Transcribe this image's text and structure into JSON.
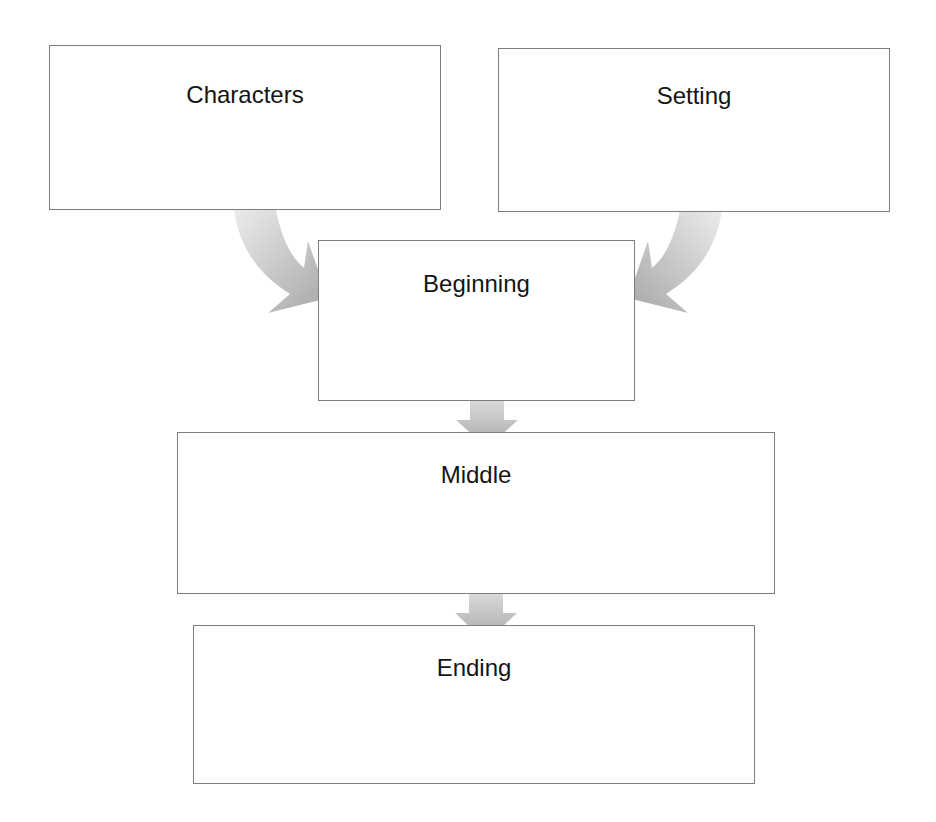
{
  "diagram": {
    "type": "story-map flowchart",
    "boxes": [
      {
        "id": "characters",
        "label": "Characters"
      },
      {
        "id": "setting",
        "label": "Setting"
      },
      {
        "id": "beginning",
        "label": "Beginning"
      },
      {
        "id": "middle",
        "label": "Middle"
      },
      {
        "id": "ending",
        "label": "Ending"
      }
    ],
    "arrows": [
      {
        "from": "characters",
        "to": "beginning",
        "style": "curved"
      },
      {
        "from": "setting",
        "to": "beginning",
        "style": "curved"
      },
      {
        "from": "beginning",
        "to": "middle",
        "style": "straight-down"
      },
      {
        "from": "middle",
        "to": "ending",
        "style": "straight-down"
      }
    ],
    "colors": {
      "border": "#7d7d7d",
      "arrow_light": "#e6e6e6",
      "arrow_dark": "#a8a8a8",
      "text": "#141414"
    }
  }
}
